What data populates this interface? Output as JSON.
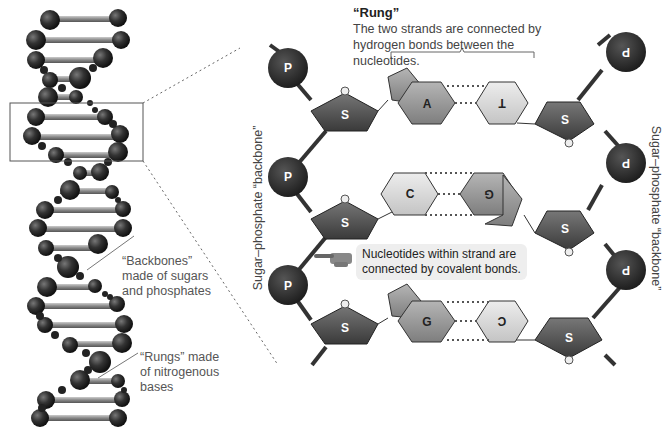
{
  "left_panel": {
    "backbones_label": [
      "“Backbones”",
      "made of sugars",
      "and phosphates"
    ],
    "rungs_label": [
      "“Rungs” made",
      "of nitrogenous",
      "bases"
    ]
  },
  "rung": {
    "title": "“Rung”",
    "description": "The two strands are connected by hydrogen bonds between the nucleotides."
  },
  "callout": {
    "line1": "Nucleotides within strand are",
    "line2": "connected by covalent bonds."
  },
  "backbone_labels": {
    "left": "Sugar–phosphate “backbone”",
    "right": "Sugar–phosphate “backbone”"
  },
  "nodes": {
    "phosphate": "P",
    "sugar": "S"
  },
  "base_pairs": [
    {
      "left": "A",
      "right": "T"
    },
    {
      "left": "C",
      "right": "G"
    },
    {
      "left": "G",
      "right": "C"
    }
  ],
  "colors": {
    "phosphate": "#2b2b2b",
    "sugar": "#5a5a5a",
    "purine": "#9a9a9a",
    "pyrimidine": "#d6d6d6",
    "text": "#444444"
  }
}
